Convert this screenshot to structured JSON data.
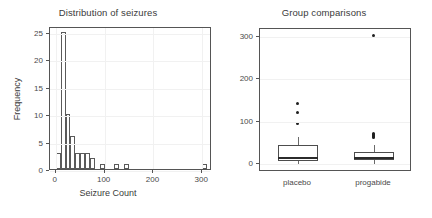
{
  "figure": {
    "width": 432,
    "height": 218,
    "background": "#ffffff",
    "panel_count": 2
  },
  "chart_data": [
    {
      "type": "bar",
      "panel": "left",
      "title": "Distribution of seizures",
      "xlabel": "Seizure Count",
      "ylabel": "Frequency",
      "xlim": [
        -12,
        320
      ],
      "ylim": [
        0,
        26
      ],
      "xticks": [
        0,
        100,
        200,
        300
      ],
      "xticklabels": [
        "0",
        "100",
        "200",
        "300"
      ],
      "yticks": [
        0,
        5,
        10,
        15,
        20,
        25
      ],
      "yticklabels": [
        "0",
        "5",
        "10",
        "15",
        "20",
        "25"
      ],
      "grid": true,
      "legend": "none",
      "bin_width": 10,
      "bin_starts": [
        0,
        10,
        20,
        30,
        40,
        50,
        60,
        70,
        80,
        90,
        100,
        110,
        120,
        130,
        140,
        150,
        300
      ],
      "categories": [
        "0-10",
        "10-20",
        "20-30",
        "30-40",
        "40-50",
        "50-60",
        "60-70",
        "70-80",
        "80-90",
        "90-100",
        "100-110",
        "110-120",
        "120-130",
        "130-140",
        "140-150",
        "150-160",
        "300-310"
      ],
      "values": [
        3,
        25,
        10,
        6,
        3,
        3,
        3,
        2,
        0,
        1,
        0,
        0,
        1,
        0,
        1,
        0,
        1
      ],
      "bar_fill": "#ffffff",
      "bar_stroke": "#5a5a5a"
    },
    {
      "type": "box",
      "panel": "right",
      "title": "Group comparisons",
      "xlabel": "",
      "ylabel": "",
      "ylim": [
        -18,
        318
      ],
      "yticks": [
        0,
        100,
        200,
        300
      ],
      "yticklabels": [
        "0",
        "100",
        "200",
        "300"
      ],
      "grid": true,
      "legend": "none",
      "categories": [
        "placebo",
        "progabide"
      ],
      "boxes": [
        {
          "name": "placebo",
          "whisker_low": 0,
          "q1": 8,
          "median": 15,
          "q3": 45,
          "whisker_high": 65,
          "outliers": [
            97,
            121,
            143
          ]
        },
        {
          "name": "progabide",
          "whisker_low": 0,
          "q1": 10,
          "median": 14,
          "q3": 30,
          "whisker_high": 45,
          "outliers": [
            63,
            66,
            68,
            71,
            73,
            302
          ]
        }
      ],
      "box_fill": "#ffffff",
      "box_stroke": "#4d4d4d",
      "median_color": "#2b2b2b",
      "outlier_color": "#1f1f1f"
    }
  ]
}
